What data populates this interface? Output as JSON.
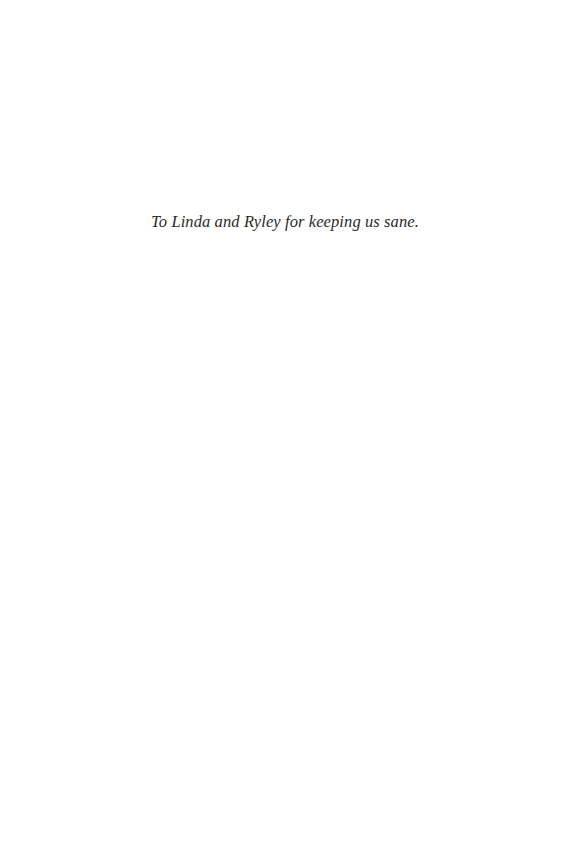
{
  "page": {
    "dedication": "To Linda and Ryley for keeping us sane."
  }
}
